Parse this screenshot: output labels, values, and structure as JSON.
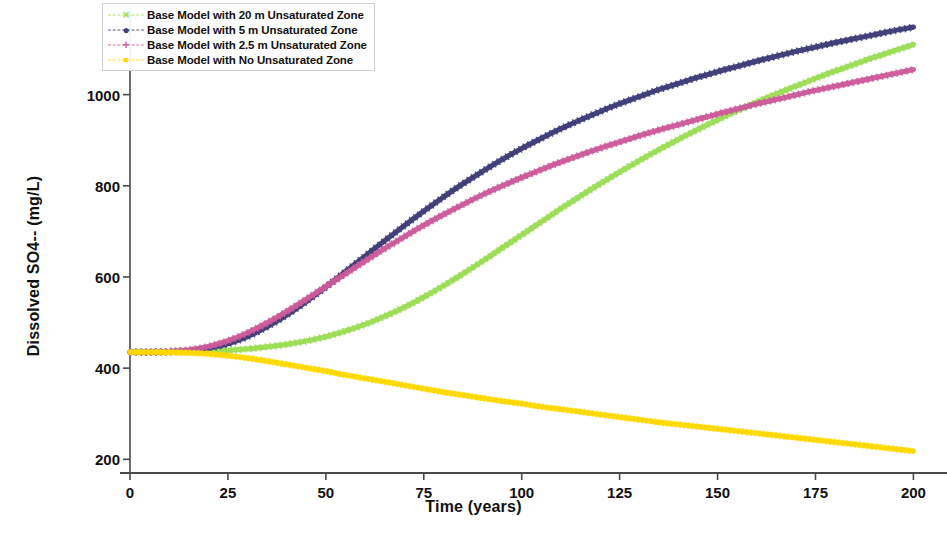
{
  "chart_data": {
    "type": "line",
    "title": "",
    "xlabel": "Time (years)",
    "ylabel": "Dissolved SO4-- (mg/L)",
    "xlim": [
      0,
      205
    ],
    "ylim": [
      170,
      1190
    ],
    "xticks": [
      0,
      25,
      50,
      75,
      100,
      125,
      150,
      175,
      200
    ],
    "yticks": [
      200,
      400,
      600,
      800,
      1000
    ],
    "grid": false,
    "legend_position": "upper left",
    "x": [
      0,
      5,
      10,
      15,
      20,
      25,
      30,
      35,
      40,
      45,
      50,
      55,
      60,
      65,
      70,
      75,
      80,
      85,
      90,
      95,
      100,
      105,
      110,
      115,
      120,
      125,
      130,
      135,
      140,
      145,
      150,
      155,
      160,
      165,
      170,
      175,
      180,
      185,
      190,
      195,
      200
    ],
    "series": [
      {
        "name": "Base Model with 20 m Unsaturated Zone",
        "color": "#9BDD55",
        "marker": "x",
        "linestyle": "dashed",
        "values": [
          435,
          435,
          435,
          435,
          436,
          438,
          441,
          445,
          450,
          457,
          466,
          478,
          492,
          509,
          528,
          550,
          574,
          600,
          627,
          655,
          683,
          711,
          739,
          766,
          792,
          817,
          841,
          864,
          886,
          907,
          927,
          946,
          964,
          981,
          997,
          1013,
          1028,
          1042,
          1056,
          1069,
          1082
        ],
        "endpoint_value": 1110
      },
      {
        "name": "Base Model with 5 m  Unsaturated Zone",
        "color": "#3E3C77",
        "marker": "o",
        "linestyle": "dashed",
        "values": [
          435,
          435,
          436,
          438,
          443,
          452,
          467,
          488,
          513,
          542,
          573,
          606,
          639,
          672,
          704,
          735,
          765,
          793,
          819,
          844,
          867,
          888,
          908,
          926,
          943,
          959,
          973,
          987,
          999,
          1011,
          1022,
          1032,
          1042,
          1051,
          1060,
          1068,
          1076,
          1083,
          1090,
          1097,
          1103
        ],
        "endpoint_value": 1148
      },
      {
        "name": "Base Model with 2.5 m  Unsaturated Zone",
        "color": "#CC5A99",
        "marker": "+",
        "linestyle": "dashed",
        "values": [
          435,
          435,
          436,
          439,
          446,
          458,
          475,
          496,
          520,
          546,
          573,
          600,
          627,
          653,
          678,
          702,
          724,
          745,
          765,
          783,
          800,
          816,
          831,
          845,
          858,
          870,
          882,
          893,
          903,
          913,
          923,
          932,
          941,
          949,
          957,
          965,
          972,
          979,
          986,
          993,
          1000
        ],
        "endpoint_value": 1055
      },
      {
        "name": "Base Model with No Unsaturated Zone",
        "color": "#FFD900",
        "marker": "s",
        "linestyle": "solid",
        "values": [
          435,
          435,
          435,
          434,
          432,
          428,
          423,
          417,
          410,
          403,
          396,
          388,
          381,
          374,
          367,
          360,
          353,
          347,
          341,
          335,
          330,
          324,
          319,
          314,
          309,
          304,
          299,
          294,
          290,
          286,
          282,
          278,
          274,
          270,
          266,
          262,
          258,
          254,
          250,
          246,
          242
        ],
        "endpoint_value": 218
      }
    ],
    "annotations": {
      "initial_concentration": 435,
      "green_magenta_crossover": {
        "x": 156,
        "y": 985
      }
    }
  },
  "legend": {
    "items": [
      {
        "label": "Base Model with 20 m Unsaturated Zone",
        "marker": "x-marker",
        "color": "#9BDD55"
      },
      {
        "label": "Base Model with 5 m  Unsaturated Zone",
        "marker": "circle-marker",
        "color": "#3E3C77"
      },
      {
        "label": "Base Model with 2.5 m  Unsaturated Zone",
        "marker": "plus-marker",
        "color": "#CC5A99"
      },
      {
        "label": "Base Model with No Unsaturated Zone",
        "marker": "square-marker",
        "color": "#FFD900"
      }
    ]
  }
}
